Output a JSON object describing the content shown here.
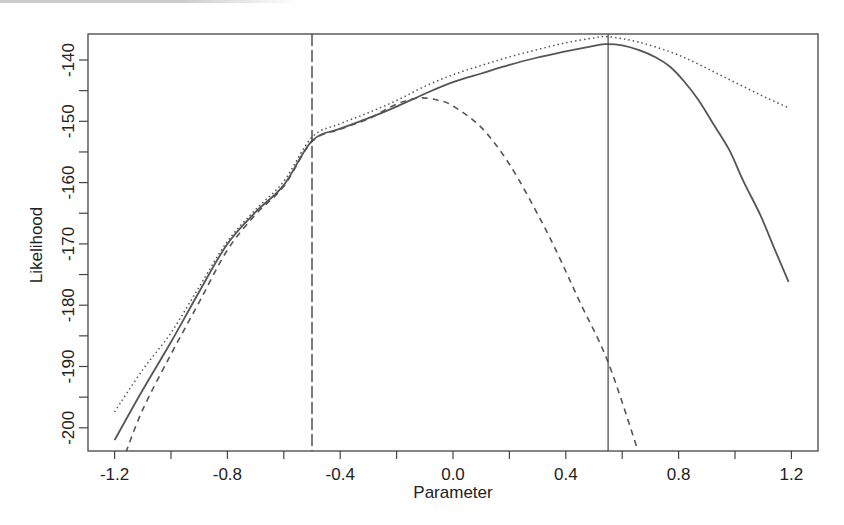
{
  "chart_data": {
    "type": "line",
    "title": "",
    "xlabel": "Parameter",
    "ylabel": "Likelihood",
    "xlim": [
      -1.28,
      1.29
    ],
    "ylim": [
      -204.5,
      -135.5
    ],
    "grid": false,
    "legend": "none",
    "x_ticks": [
      -1.2,
      -1.0,
      -0.8,
      -0.6,
      -0.4,
      -0.2,
      0.0,
      0.2,
      0.4,
      0.6,
      0.8,
      1.0,
      1.2
    ],
    "x_tick_labels": [
      {
        "value": -1.2,
        "label": "-1.2"
      },
      {
        "value": -0.8,
        "label": "-0.8"
      },
      {
        "value": -0.4,
        "label": "-0.4"
      },
      {
        "value": 0.0,
        "label": "0.0"
      },
      {
        "value": 0.4,
        "label": "0.4"
      },
      {
        "value": 0.8,
        "label": "0.8"
      },
      {
        "value": 1.2,
        "label": "1.2"
      }
    ],
    "y_ticks": [
      -200,
      -195,
      -190,
      -185,
      -180,
      -175,
      -170,
      -165,
      -160,
      -155,
      -150,
      -145,
      -140
    ],
    "y_tick_labels": [
      {
        "value": -200,
        "label": "-200"
      },
      {
        "value": -190,
        "label": "-190"
      },
      {
        "value": -180,
        "label": "-180"
      },
      {
        "value": -170,
        "label": "-170"
      },
      {
        "value": -160,
        "label": "-160"
      },
      {
        "value": -150,
        "label": "-150"
      },
      {
        "value": -140,
        "label": "-140"
      }
    ],
    "series": [
      {
        "name": "solid",
        "style": "solid",
        "x": [
          -1.2,
          -1.1,
          -1.0,
          -0.9,
          -0.8,
          -0.7,
          -0.6,
          -0.5,
          -0.4,
          -0.3,
          -0.2,
          -0.1,
          0.0,
          0.1,
          0.2,
          0.3,
          0.4,
          0.5,
          0.54,
          0.6,
          0.66,
          0.72,
          0.77,
          0.82,
          0.87,
          0.92,
          0.98,
          1.03,
          1.09,
          1.14,
          1.19
        ],
        "y": [
          -202.0,
          -193.8,
          -186.0,
          -177.8,
          -170.0,
          -164.8,
          -160.4,
          -153.2,
          -151.2,
          -149.5,
          -147.6,
          -145.5,
          -143.6,
          -142.2,
          -140.8,
          -139.6,
          -138.6,
          -137.7,
          -137.4,
          -137.6,
          -138.4,
          -139.6,
          -141.1,
          -143.5,
          -146.5,
          -150.2,
          -154.7,
          -159.8,
          -165.3,
          -170.8,
          -176.2
        ]
      },
      {
        "name": "dotted",
        "style": "dotted",
        "x": [
          -1.2,
          -1.1,
          -1.0,
          -0.9,
          -0.8,
          -0.7,
          -0.6,
          -0.5,
          -0.4,
          -0.3,
          -0.2,
          -0.1,
          0.0,
          0.1,
          0.2,
          0.3,
          0.4,
          0.5,
          0.55,
          0.66,
          0.8,
          0.945,
          1.09,
          1.19
        ],
        "y": [
          -197.4,
          -190.5,
          -184.5,
          -177.0,
          -169.6,
          -164.4,
          -159.8,
          -152.6,
          -150.4,
          -148.6,
          -146.6,
          -144.3,
          -142.4,
          -140.9,
          -139.5,
          -138.3,
          -137.2,
          -136.4,
          -136.2,
          -137.1,
          -139.2,
          -142.4,
          -145.7,
          -147.8
        ]
      },
      {
        "name": "dashed",
        "style": "dashed",
        "x": [
          -1.16,
          -1.1,
          -1.0,
          -0.9,
          -0.8,
          -0.7,
          -0.6,
          -0.5,
          -0.4,
          -0.3,
          -0.2,
          -0.12,
          -0.05,
          0.0,
          0.1,
          0.2,
          0.31,
          0.38,
          0.45,
          0.55,
          0.655
        ],
        "y": [
          -204.0,
          -197.0,
          -188.0,
          -179.5,
          -171.0,
          -165.2,
          -160.6,
          -153.3,
          -151.3,
          -149.6,
          -147.2,
          -146.2,
          -146.6,
          -147.5,
          -151.0,
          -157.0,
          -166.0,
          -172.5,
          -179.5,
          -189.3,
          -203.6
        ]
      }
    ],
    "vertical_lines": [
      {
        "name": "dashed-vline",
        "x": -0.5,
        "style": "longdash"
      },
      {
        "name": "solid-vline",
        "x": 0.55,
        "style": "solid"
      }
    ]
  }
}
